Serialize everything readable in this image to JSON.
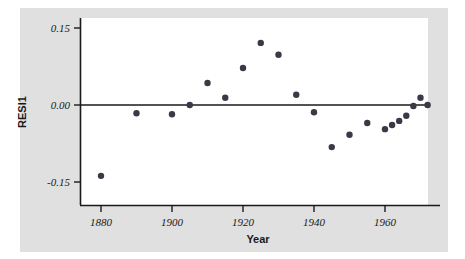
{
  "chart_data": {
    "type": "scatter",
    "title": "",
    "xlabel": "Year",
    "ylabel": "RESI1",
    "xlim": [
      1872,
      1977
    ],
    "ylim": [
      -0.185,
      0.172
    ],
    "xticks": [
      1880,
      1900,
      1920,
      1940,
      1960
    ],
    "xtick_labels": [
      "1880",
      "1900",
      "1920",
      "1940",
      "1960"
    ],
    "yticks": [
      0.15,
      0.0,
      -0.15
    ],
    "ytick_labels": [
      "0.15",
      "0.00",
      "-0.15"
    ],
    "grid": false,
    "legend": null,
    "reference_line": {
      "y": 0.0,
      "label": "zero-residual-line"
    },
    "marker": {
      "shape": "circle",
      "color": "#3a3a46",
      "size": 3.2
    },
    "x": [
      1880,
      1890,
      1900,
      1905,
      1910,
      1915,
      1920,
      1925,
      1930,
      1935,
      1940,
      1945,
      1950,
      1955,
      1960,
      1962,
      1964,
      1966,
      1968,
      1970,
      1972
    ],
    "values": [
      -0.138,
      -0.016,
      -0.018,
      0.0,
      0.043,
      0.014,
      0.072,
      0.121,
      0.098,
      0.02,
      -0.014,
      -0.082,
      -0.058,
      -0.035,
      -0.047,
      -0.039,
      -0.031,
      -0.021,
      -0.002,
      0.014,
      0.0
    ],
    "points": [
      {
        "year": 1880,
        "resi": -0.138
      },
      {
        "year": 1890,
        "resi": -0.016
      },
      {
        "year": 1900,
        "resi": -0.018
      },
      {
        "year": 1905,
        "resi": 0.0
      },
      {
        "year": 1910,
        "resi": 0.043
      },
      {
        "year": 1915,
        "resi": 0.014
      },
      {
        "year": 1920,
        "resi": 0.072
      },
      {
        "year": 1925,
        "resi": 0.121
      },
      {
        "year": 1930,
        "resi": 0.098
      },
      {
        "year": 1935,
        "resi": 0.02
      },
      {
        "year": 1940,
        "resi": -0.014
      },
      {
        "year": 1945,
        "resi": -0.082
      },
      {
        "year": 1950,
        "resi": -0.058
      },
      {
        "year": 1955,
        "resi": -0.035
      },
      {
        "year": 1960,
        "resi": -0.047
      },
      {
        "year": 1962,
        "resi": -0.039
      },
      {
        "year": 1964,
        "resi": -0.031
      },
      {
        "year": 1966,
        "resi": -0.021
      },
      {
        "year": 1968,
        "resi": -0.002
      },
      {
        "year": 1970,
        "resi": 0.014
      },
      {
        "year": 1972,
        "resi": 0.0
      }
    ],
    "colors": {
      "figure_background": "#ffffff",
      "panel_background": "#e0e0e0",
      "plot_background": "#ffffff",
      "axis": "#1a1a1a",
      "marker": "#3a3a46",
      "text": "#1a1a1a"
    }
  }
}
